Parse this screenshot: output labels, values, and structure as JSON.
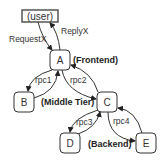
{
  "diagram": {
    "nodes": {
      "user": "(user)",
      "A": "A",
      "B": "B",
      "C": "C",
      "D": "D",
      "E": "E"
    },
    "edges": {
      "request": "RequestX",
      "reply": "ReplyX",
      "rpc1": "rpc1",
      "rpc2": "rpc2",
      "rpc3": "rpc3",
      "rpc4": "rpc4"
    },
    "tiers": {
      "frontend": "(Frontend)",
      "middle": "(Middle Tier)",
      "backend": "(Backend)"
    },
    "colors": {
      "stroke": "#333333",
      "user_box_stroke": "#555555"
    }
  }
}
